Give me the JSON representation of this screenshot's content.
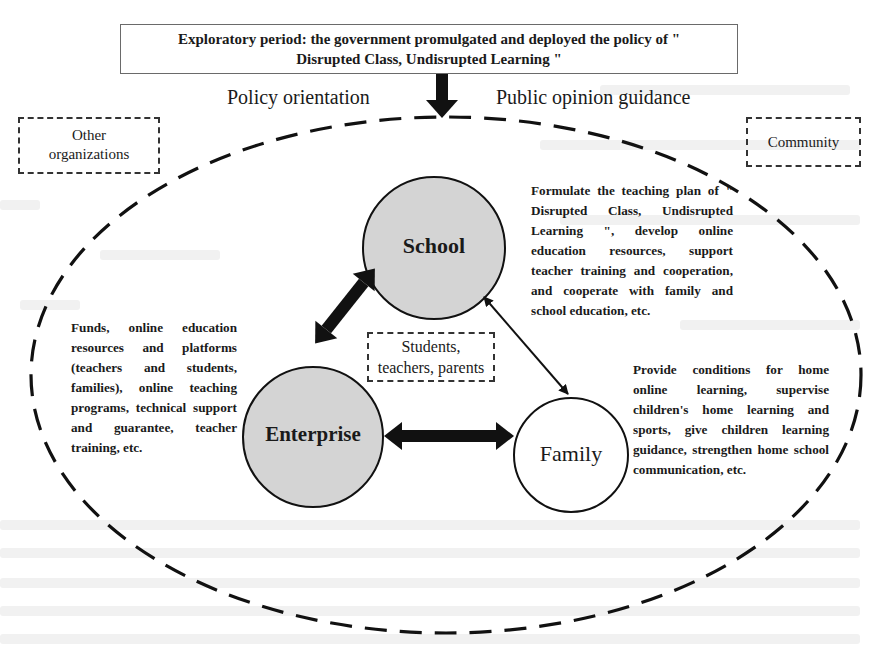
{
  "header": {
    "title_line1": "Exploratory period: the government promulgated and deployed the policy of \"",
    "title_line2": "Disrupted Class, Undisrupted Learning \""
  },
  "arrow_labels": {
    "left": "Policy orientation",
    "right": "Public opinion guidance"
  },
  "outer_boxes": {
    "left": {
      "line1": "Other",
      "line2": "organizations"
    },
    "right": {
      "line1": "Community"
    }
  },
  "nodes": {
    "school": {
      "label": "School",
      "fill": "#d4d4d4"
    },
    "enterprise": {
      "label": "Enterprise",
      "fill": "#d4d4d4"
    },
    "family": {
      "label": "Family",
      "fill": "#ffffff"
    }
  },
  "center_box": {
    "line1": "Students,",
    "line2": "teachers, parents"
  },
  "descriptions": {
    "school": "Formulate the teaching plan of \" Disrupted Class, Undisrupted Learning \", develop online education resources, support teacher training and cooperation, and cooperate with family and school education, etc.",
    "enterprise": "Funds, online education resources and platforms (teachers and students, families), online teaching programs, technical support and guarantee, teacher training, etc.",
    "family": "Provide conditions for home online learning, supervise children's home learning and sports, give children learning guidance, strengthen home school communication, etc."
  },
  "edges": [
    {
      "from": "enterprise",
      "to": "school",
      "style": "thick-bidirectional"
    },
    {
      "from": "enterprise",
      "to": "family",
      "style": "thick-bidirectional"
    },
    {
      "from": "family",
      "to": "school",
      "style": "thin-bidirectional"
    }
  ]
}
